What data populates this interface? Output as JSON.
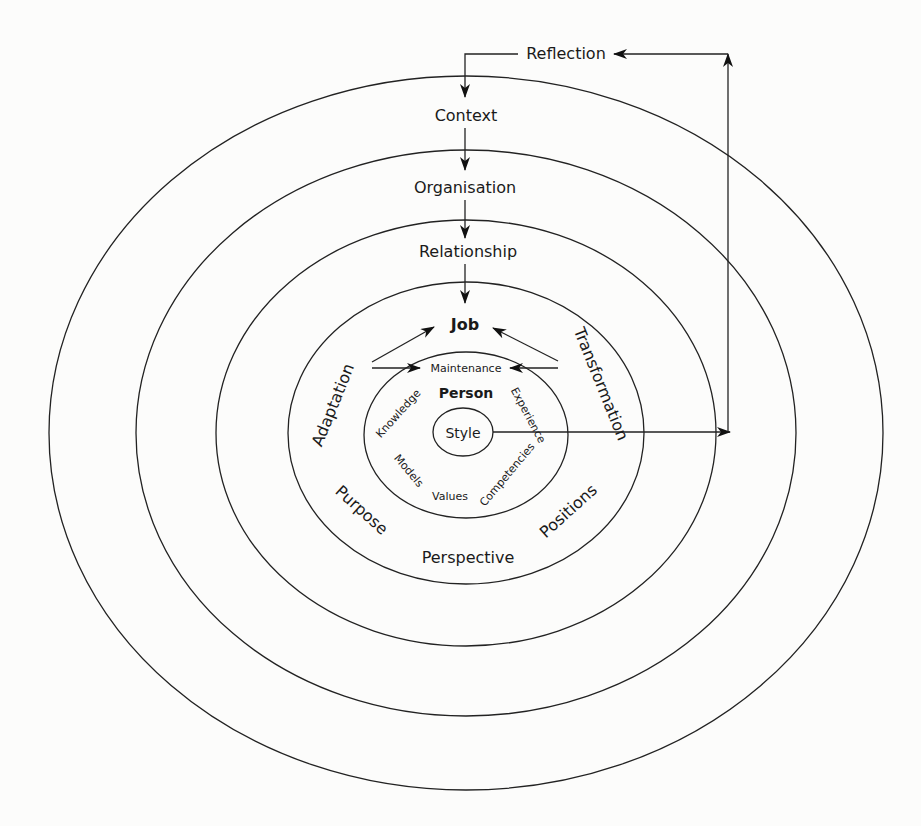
{
  "diagram": {
    "type": "concentric-ellipses",
    "colors": {
      "stroke": "#222222",
      "text": "#1a1a1a",
      "background": "#fcfcfb"
    },
    "feedback_loop": {
      "label": "Reflection",
      "flow": [
        "Style",
        "Reflection",
        "Context"
      ]
    },
    "rings": [
      {
        "id": "context",
        "label": "Context"
      },
      {
        "id": "organisation",
        "label": "Organisation"
      },
      {
        "id": "relationship",
        "label": "Relationship"
      },
      {
        "id": "job",
        "label": "Job"
      },
      {
        "id": "person",
        "label": "Person"
      },
      {
        "id": "style",
        "label": "Style"
      }
    ],
    "job_ring_labels": {
      "left_top": "Adaptation",
      "right_top": "Transformation",
      "left_bottom": "Purpose",
      "bottom": "Perspective",
      "right_bottom": "Positions"
    },
    "job_person_boundary": "Maintenance",
    "person_ring_labels": {
      "upper_left": "Knowledge",
      "upper_right": "Experience",
      "lower_left": "Models",
      "bottom": "Values",
      "lower_right": "Competencies"
    },
    "top_flow": [
      "Reflection",
      "Context",
      "Organisation",
      "Relationship",
      "Job"
    ]
  }
}
